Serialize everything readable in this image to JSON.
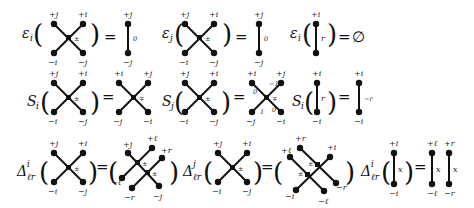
{
  "rows": [
    {
      "name": "epsilon-row",
      "equations": [
        {
          "operator": "ε",
          "operator_sub": "i",
          "lhs": {
            "type": "crossing",
            "labels": {
              "tl": "+j",
              "tr": "+i",
              "bl": "−i",
              "br": "−j"
            },
            "center": "±"
          },
          "equals": "=",
          "rhs": {
            "type": "strand",
            "labels": {
              "top": "+j",
              "bottom": "−j",
              "side": "0"
            }
          }
        },
        {
          "operator": "ε",
          "operator_sub": "j",
          "lhs": {
            "type": "crossing",
            "labels": {
              "tl": "+j",
              "tr": "+i",
              "bl": "−i",
              "br": "−j"
            },
            "center": "±"
          },
          "equals": "=",
          "rhs": {
            "type": "strand",
            "labels": {
              "top": "+j",
              "bottom": "−j",
              "side": "0"
            }
          }
        },
        {
          "operator": "ε",
          "operator_sub": "i",
          "lhs": {
            "type": "strand",
            "labels": {
              "top": "+i",
              "bottom": "−i",
              "side": "r"
            }
          },
          "equals": "=",
          "rhs": {
            "type": "text",
            "value": "∅"
          }
        }
      ]
    },
    {
      "name": "s-row",
      "equations": [
        {
          "operator": "S",
          "operator_sub": "i",
          "lhs": {
            "type": "crossing",
            "labels": {
              "tl": "+j",
              "tr": "+i",
              "bl": "−i",
              "br": "−j"
            },
            "center": "±"
          },
          "equals": "=",
          "rhs": {
            "type": "crossing",
            "labels": {
              "tl": "+i",
              "tr": "+j",
              "bl": "−j",
              "br": "−i"
            },
            "center": "∓"
          }
        },
        {
          "operator": "S",
          "operator_sub": "j",
          "lhs": {
            "type": "crossing",
            "labels": {
              "tl": "+j",
              "tr": "+i",
              "bl": "−i",
              "br": "−j"
            },
            "center": "±"
          },
          "equals": "=",
          "rhs": {
            "type": "crossing",
            "labels": {
              "tl": "+i",
              "tr": "+j",
              "bl": "−j",
              "br": "−i"
            },
            "center": "∓",
            "edge_labels": {
              "tl": "0",
              "tr": "−1",
              "bl": "1",
              "br": "0"
            }
          }
        },
        {
          "operator": "S",
          "operator_sub": "i",
          "lhs": {
            "type": "strand",
            "labels": {
              "top": "+i",
              "bottom": "−i",
              "side": "r"
            }
          },
          "equals": "=",
          "rhs": {
            "type": "strand",
            "labels": {
              "top": "+i",
              "bottom": "−i",
              "side": "−r"
            }
          }
        }
      ]
    },
    {
      "name": "delta-row",
      "equations": [
        {
          "operator": "Δ",
          "operator_sub": "ℓr",
          "operator_sup": "i",
          "lhs": {
            "type": "crossing",
            "labels": {
              "tl": "+j",
              "tr": "+i",
              "bl": "−i",
              "br": "−j"
            },
            "center": "±"
          },
          "equals": "=",
          "rhs": {
            "type": "double-crossing",
            "labels": {
              "tl": "+j",
              "tr1": "+ℓ",
              "tr2": "+r",
              "bl1": "−ℓ",
              "bl2": "−r",
              "br": "−j"
            },
            "centers": [
              "±",
              "±"
            ]
          }
        },
        {
          "operator": "Δ",
          "operator_sub": "ℓr",
          "operator_sup": "j",
          "lhs": {
            "type": "crossing",
            "labels": {
              "tl": "+j",
              "tr": "+i",
              "bl": "−i",
              "br": "−j"
            },
            "center": "±"
          },
          "equals": "=",
          "rhs": {
            "type": "double-crossing",
            "labels": {
              "tl1": "+ℓ",
              "tl2": "+r",
              "tr": "+i",
              "bl": "−i",
              "br1": "−ℓ",
              "br2": "−r"
            },
            "centers": [
              "±",
              "±"
            ]
          }
        },
        {
          "operator": "Δ",
          "operator_sub": "ℓr",
          "operator_sup": "i",
          "lhs": {
            "type": "strand",
            "labels": {
              "top": "+i",
              "bottom": "−i",
              "side": "x"
            }
          },
          "equals": "=",
          "rhs": {
            "type": "strand-pair",
            "strands": [
              {
                "top": "+ℓ",
                "bottom": "−ℓ",
                "side": "x"
              },
              {
                "top": "+r",
                "bottom": "−r",
                "side": "x"
              }
            ]
          }
        }
      ]
    }
  ]
}
